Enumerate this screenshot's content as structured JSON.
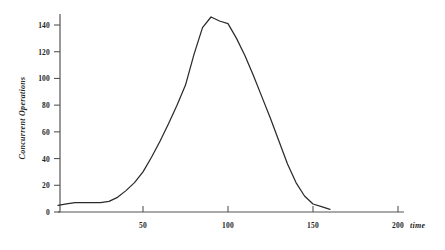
{
  "chart_data": {
    "type": "line",
    "title": "",
    "subtitle": "",
    "xlabel": "time",
    "ylabel": "Concurrent Operations",
    "xlim": [
      0,
      205
    ],
    "ylim": [
      0,
      152
    ],
    "grid": false,
    "legend": null,
    "legend_position": "none",
    "line_color": "#2b2b2b",
    "axis_color": "#555555",
    "background_color": "#ffffff",
    "x_ticks": [
      50,
      100,
      150,
      200
    ],
    "x_tick_labels": [
      "50",
      "100",
      "150",
      "200"
    ],
    "y_ticks": [
      0,
      20,
      40,
      60,
      80,
      100,
      120,
      140
    ],
    "y_tick_labels": [
      "0",
      "20",
      "40",
      "60",
      "80",
      "100",
      "120",
      "140"
    ],
    "series": [
      {
        "name": "Concurrent Operations",
        "x": [
          0,
          5,
          10,
          15,
          20,
          25,
          30,
          35,
          40,
          45,
          50,
          55,
          60,
          65,
          70,
          75,
          80,
          85,
          90,
          95,
          100,
          105,
          110,
          115,
          120,
          125,
          130,
          135,
          140,
          145,
          150,
          155,
          160
        ],
        "values": [
          5,
          6,
          7,
          7,
          7,
          7,
          8,
          11,
          16,
          22,
          30,
          41,
          53,
          66,
          80,
          95,
          118,
          138,
          146,
          143,
          141,
          130,
          117,
          102,
          86,
          70,
          53,
          36,
          22,
          12,
          6,
          4,
          2
        ]
      }
    ],
    "annotations": []
  },
  "axes": {
    "y_axis_name": "y-axis",
    "x_axis_name": "x-axis"
  }
}
